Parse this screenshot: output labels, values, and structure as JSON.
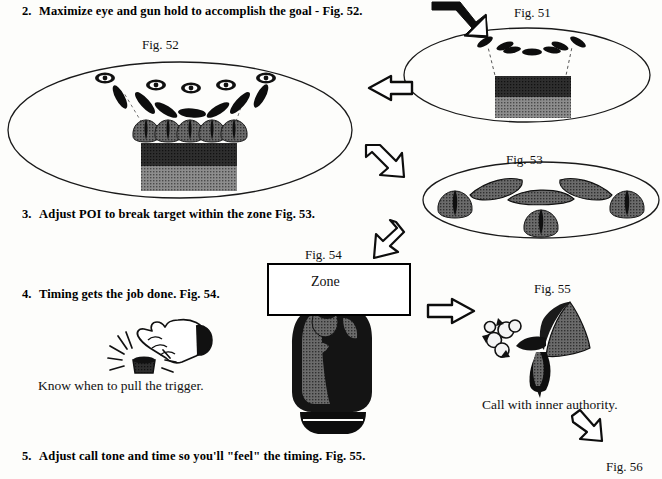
{
  "document": {
    "title": "Shotgun shooting instructional page - steps 2 through 5",
    "background_color": "#fdfdfb",
    "ink_color": "#000000"
  },
  "steps": [
    {
      "number": "2.",
      "text": "Maximize eye and gun hold to accomplish the goal - Fig. 52.",
      "x": 22,
      "y": 4
    },
    {
      "number": "3.",
      "text": "Adjust POI to break target within the zone Fig. 53.",
      "x": 22,
      "y": 207
    },
    {
      "number": "4.",
      "text": "Timing gets the job done. Fig. 54.",
      "x": 22,
      "y": 287
    },
    {
      "number": "5.",
      "text": "Adjust call tone and time so you'll \"feel\" the timing. Fig. 55.",
      "x": 22,
      "y": 449
    }
  ],
  "figure_labels": [
    {
      "name": "fig-51-label",
      "text": "Fig. 51",
      "x": 514,
      "y": 5
    },
    {
      "name": "fig-52-label",
      "text": "Fig. 52",
      "x": 142,
      "y": 37
    },
    {
      "name": "fig-53-label",
      "text": "Fig. 53",
      "x": 506,
      "y": 152
    },
    {
      "name": "fig-54-label",
      "text": "Fig. 54",
      "x": 305,
      "y": 247
    },
    {
      "name": "fig-55-label",
      "text": "Fig. 55",
      "x": 534,
      "y": 281
    },
    {
      "name": "fig-56-label",
      "text": "Fig. 56",
      "x": 606,
      "y": 459
    }
  ],
  "captions": [
    {
      "name": "trigger-caption",
      "text": "Know when to pull the trigger.",
      "x": 38,
      "y": 378
    },
    {
      "name": "call-caption",
      "text": "Call with inner authority.",
      "x": 482,
      "y": 397
    }
  ],
  "zone_box": {
    "label": "Zone",
    "x": 267,
    "y": 263,
    "width": 144,
    "height": 53,
    "dash_count": 7
  },
  "figures": {
    "fig51": {
      "name": "fig-51-diagram",
      "description": "Ellipse with arc of 7 dark dashes above a two-tone shaded rectangle, connected by dashed lines",
      "ellipse": {
        "cx": 527,
        "cy": 75,
        "rx": 123,
        "ry": 47
      },
      "dash_count": 7,
      "block": {
        "x": 495,
        "y": 76,
        "width": 76,
        "height": 42
      },
      "block_top_color": "#2b2b2b",
      "block_bottom_color": "#6e6e6e"
    },
    "fig52": {
      "name": "fig-52-diagram",
      "description": "Large ellipse containing 5 eye icons with angled dark dashes, a row of 5 shaded target heads, and a two-tone block",
      "ellipse": {
        "cx": 180,
        "cy": 130,
        "rx": 172,
        "ry": 68
      },
      "eye_count": 5,
      "head_count": 5,
      "block": {
        "x": 141,
        "y": 133,
        "width": 96,
        "height": 48
      },
      "block_top_color": "#2b2b2b",
      "block_bottom_color": "#6e6e6e"
    },
    "fig53": {
      "name": "fig-53-diagram",
      "description": "Ellipse containing 4 shaded target heads and 3 elongated shaded streak shapes in a V arrangement",
      "ellipse": {
        "cx": 541,
        "cy": 200,
        "rx": 118,
        "ry": 38
      },
      "head_count": 4,
      "streak_count": 3
    },
    "fig54": {
      "name": "fig-54-diagram",
      "description": "Rectangular Zone box with 7 dark dashes and a gloved fist gripping below it"
    },
    "fig55": {
      "name": "fig-55-diagram",
      "description": "Shaded megaphone/horn shape with a burst of sound puffs at the mouth"
    },
    "trigger_hand": {
      "name": "trigger-hand-diagram",
      "description": "Line drawing of a hand with index finger pressing a small button, with impact rays"
    }
  },
  "arrows": [
    {
      "name": "arrow-into-fig51",
      "direction": "down-right",
      "x": 432,
      "y": 2
    },
    {
      "name": "arrow-fig51-to-fig52",
      "direction": "left",
      "x": 369,
      "y": 82
    },
    {
      "name": "arrow-fig52-to-fig53",
      "direction": "down-right",
      "x": 366,
      "y": 143
    },
    {
      "name": "arrow-fig53-to-fig54",
      "direction": "down-left",
      "x": 365,
      "y": 222
    },
    {
      "name": "arrow-fig54-to-fig55",
      "direction": "right",
      "x": 426,
      "y": 305
    },
    {
      "name": "arrow-to-fig56",
      "direction": "down-right",
      "x": 570,
      "y": 415
    }
  ]
}
